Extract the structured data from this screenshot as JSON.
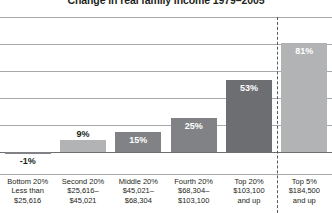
{
  "chart_data": {
    "type": "bar",
    "title": "Change in real family income 1979–2005",
    "xlabel": "",
    "ylabel": "",
    "ylim": [
      -20,
      100
    ],
    "grid": true,
    "gridline_values": [
      100,
      80,
      60,
      40,
      20,
      0
    ],
    "legend": "none",
    "categories": [
      "Bottom 20%",
      "Second 20%",
      "Middle 20%",
      "Fourth 20%",
      "Top 20%",
      "Top 5%"
    ],
    "category_sublabels": [
      [
        "Less than",
        "$25,616"
      ],
      [
        "$25,616–",
        "$45,021"
      ],
      [
        "$45,021–",
        "$68,304"
      ],
      [
        "$68,304–",
        "$103,100"
      ],
      [
        "$103,100",
        "and up"
      ],
      [
        "$184,500",
        "and up"
      ]
    ],
    "values": [
      -1,
      9,
      15,
      25,
      53,
      81
    ],
    "value_labels": [
      "-1%",
      "9%",
      "15%",
      "25%",
      "53%",
      "81%"
    ],
    "bar_colors": [
      "#808285",
      "#b2b3b5",
      "#808285",
      "#808285",
      "#6d6e71",
      "#b2b3b5"
    ],
    "label_placement": [
      "outside",
      "outside",
      "inside",
      "inside",
      "inside",
      "inside"
    ],
    "annotations": [
      {
        "name": "top5-separator",
        "type": "vertical-dashed-line",
        "position_between": [
          "Top 20%",
          "Top 5%"
        ],
        "color": "#58595b"
      }
    ]
  },
  "colors": {
    "gridline": "#a7a9ac",
    "zero_line": "#6d6e71",
    "axis_line": "#a7a9ac",
    "text": "#231f20",
    "label_inside": "#ffffff",
    "background": "#ffffff"
  }
}
